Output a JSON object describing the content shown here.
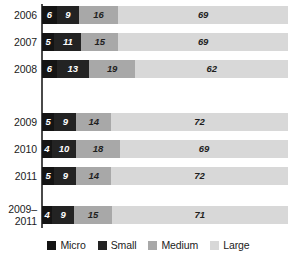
{
  "chart_data": {
    "type": "bar",
    "orientation": "horizontal",
    "stacked": true,
    "normalized_percent": true,
    "title": "",
    "subtitle": "",
    "xlabel": "",
    "ylabel": "",
    "xlim": [
      0,
      100
    ],
    "grid": false,
    "legend_position": "bottom",
    "categories": [
      "2006",
      "2007",
      "2008",
      "2009",
      "2010",
      "2011",
      "2009–\n2011"
    ],
    "series": [
      {
        "name": "Micro",
        "color": "#141414",
        "values": [
          6,
          5,
          6,
          5,
          4,
          5,
          4
        ]
      },
      {
        "name": "Small",
        "color": "#232323",
        "values": [
          9,
          11,
          13,
          9,
          10,
          9,
          9
        ]
      },
      {
        "name": "Medium",
        "color": "#a8a8a8",
        "values": [
          16,
          15,
          19,
          14,
          18,
          14,
          15
        ]
      },
      {
        "name": "Large",
        "color": "#d8d8d8",
        "values": [
          69,
          69,
          62,
          72,
          69,
          72,
          71
        ]
      }
    ]
  },
  "rows": [
    {
      "label": "2006",
      "label_lines": [
        "2006"
      ],
      "segments": [
        {
          "series": "Micro",
          "value": "6"
        },
        {
          "series": "Small",
          "value": "9"
        },
        {
          "series": "Medium",
          "value": "16"
        },
        {
          "series": "Large",
          "value": "69"
        }
      ]
    },
    {
      "label": "2007",
      "label_lines": [
        "2007"
      ],
      "segments": [
        {
          "series": "Micro",
          "value": "5"
        },
        {
          "series": "Small",
          "value": "11"
        },
        {
          "series": "Medium",
          "value": "15"
        },
        {
          "series": "Large",
          "value": "69"
        }
      ]
    },
    {
      "label": "2008",
      "label_lines": [
        "2008"
      ],
      "segments": [
        {
          "series": "Micro",
          "value": "6"
        },
        {
          "series": "Small",
          "value": "13"
        },
        {
          "series": "Medium",
          "value": "19"
        },
        {
          "series": "Large",
          "value": "62"
        }
      ]
    },
    {
      "label": "2009",
      "label_lines": [
        "2009"
      ],
      "segments": [
        {
          "series": "Micro",
          "value": "5"
        },
        {
          "series": "Small",
          "value": "9"
        },
        {
          "series": "Medium",
          "value": "14"
        },
        {
          "series": "Large",
          "value": "72"
        }
      ]
    },
    {
      "label": "2010",
      "label_lines": [
        "2010"
      ],
      "segments": [
        {
          "series": "Micro",
          "value": "4"
        },
        {
          "series": "Small",
          "value": "10"
        },
        {
          "series": "Medium",
          "value": "18"
        },
        {
          "series": "Large",
          "value": "69"
        }
      ]
    },
    {
      "label": "2011",
      "label_lines": [
        "2011"
      ],
      "segments": [
        {
          "series": "Micro",
          "value": "5"
        },
        {
          "series": "Small",
          "value": "9"
        },
        {
          "series": "Medium",
          "value": "14"
        },
        {
          "series": "Large",
          "value": "72"
        }
      ]
    },
    {
      "label": "2009–2011",
      "label_lines": [
        "2009–",
        "2011"
      ],
      "segments": [
        {
          "series": "Micro",
          "value": "4"
        },
        {
          "series": "Small",
          "value": "9"
        },
        {
          "series": "Medium",
          "value": "15"
        },
        {
          "series": "Large",
          "value": "71"
        }
      ]
    }
  ],
  "legend": {
    "items": [
      {
        "label": "Micro",
        "color": "#141414"
      },
      {
        "label": "Small",
        "color": "#232323"
      },
      {
        "label": "Medium",
        "color": "#a8a8a8"
      },
      {
        "label": "Large",
        "color": "#d8d8d8"
      }
    ]
  }
}
